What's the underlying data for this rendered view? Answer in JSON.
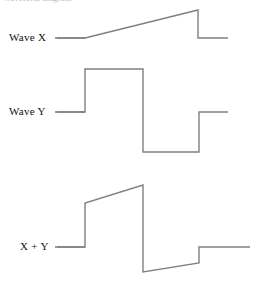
{
  "figure": {
    "width": 267,
    "height": 284,
    "background_color": "#ffffff",
    "clipped_heading_text": "waveform diagram",
    "stroke_color": "#808080",
    "label_color": "#111111"
  },
  "labels": {
    "wave_x": "Wave X",
    "wave_y": "Wave Y",
    "sum": "X + Y"
  },
  "chart_data": {
    "type": "line",
    "title": "",
    "xlabel": "",
    "ylabel": "",
    "grid": false,
    "legend_position": "left-inline",
    "axis_ranges": {
      "x": [
        55,
        250
      ],
      "y": [
        0,
        284
      ]
    },
    "series": [
      {
        "name": "Wave X",
        "label": "Wave X",
        "description": "flat low segment, then a linear ramp rising to a peak, then a sharp drop back to the low level, then flat",
        "color": "#808080",
        "points": [
          [
            55,
            38
          ],
          [
            85,
            38
          ],
          [
            198,
            10
          ],
          [
            198,
            38
          ],
          [
            228,
            38
          ]
        ]
      },
      {
        "name": "Wave Y",
        "label": "Wave Y",
        "description": "square wave: mid level, high pulse, low pulse, back to mid level",
        "color": "#808080",
        "points": [
          [
            55,
            112
          ],
          [
            85,
            112
          ],
          [
            85,
            69
          ],
          [
            143,
            69
          ],
          [
            143,
            152
          ],
          [
            199,
            152
          ],
          [
            199,
            112
          ],
          [
            228,
            112
          ]
        ]
      },
      {
        "name": "X + Y",
        "label": "X + Y",
        "description": "point-by-point sum of Wave X and Wave Y: step up, rising ramp, sharp drop, slow rising ramp, step up, flat",
        "color": "#808080",
        "points": [
          [
            55,
            247
          ],
          [
            85,
            247
          ],
          [
            85,
            203
          ],
          [
            143,
            185
          ],
          [
            143,
            272
          ],
          [
            199,
            263
          ],
          [
            199,
            247
          ],
          [
            250,
            247
          ]
        ]
      }
    ],
    "leader_lines": [
      {
        "name": "wave-x-leader",
        "x1": 57,
        "y1": 38,
        "x2": 85,
        "y2": 38
      },
      {
        "name": "wave-y-leader",
        "x1": 57,
        "y1": 112,
        "x2": 85,
        "y2": 112
      },
      {
        "name": "sum-leader",
        "x1": 57,
        "y1": 247,
        "x2": 85,
        "y2": 247
      }
    ]
  }
}
